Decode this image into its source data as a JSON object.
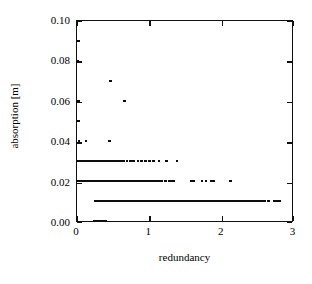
{
  "chart_data": {
    "type": "scatter",
    "title": "",
    "xlabel": "redundancy",
    "ylabel": "absorption [m]",
    "xlim": [
      0,
      3
    ],
    "ylim": [
      0.0,
      0.1
    ],
    "xticks": [
      0,
      1,
      2,
      3
    ],
    "yticks": [
      0.0,
      0.02,
      0.04,
      0.06,
      0.08,
      0.1
    ],
    "xtick_labels": [
      "0",
      "1",
      "2",
      "3"
    ],
    "ytick_labels": [
      "0.00",
      "0.02",
      "0.04",
      "0.06",
      "0.08",
      "0.10"
    ],
    "grid": false,
    "legend": null,
    "marker": "square",
    "marker_color": "#0d0d0d",
    "marker_size_px": 2.6,
    "series": [
      {
        "name": "absorption",
        "points": [
          [
            0.02,
            0.09
          ],
          [
            0.012,
            0.08
          ],
          [
            0.47,
            0.07
          ],
          [
            0.02,
            0.06
          ],
          [
            0.665,
            0.06
          ],
          [
            0.02,
            0.05
          ],
          [
            0.03,
            0.04
          ],
          [
            0.125,
            0.04
          ],
          [
            0.45,
            0.04
          ],
          [
            0.02,
            0.03
          ],
          [
            0.05,
            0.03
          ],
          [
            0.09,
            0.03
          ],
          [
            0.13,
            0.03
          ],
          [
            0.175,
            0.03
          ],
          [
            0.205,
            0.03
          ],
          [
            0.235,
            0.03
          ],
          [
            0.265,
            0.03
          ],
          [
            0.3,
            0.03
          ],
          [
            0.33,
            0.03
          ],
          [
            0.36,
            0.03
          ],
          [
            0.39,
            0.03
          ],
          [
            0.42,
            0.03
          ],
          [
            0.45,
            0.03
          ],
          [
            0.48,
            0.03
          ],
          [
            0.51,
            0.03
          ],
          [
            0.54,
            0.03
          ],
          [
            0.575,
            0.03
          ],
          [
            0.61,
            0.03
          ],
          [
            0.65,
            0.03
          ],
          [
            0.7,
            0.03
          ],
          [
            0.745,
            0.03
          ],
          [
            0.79,
            0.03
          ],
          [
            0.85,
            0.03
          ],
          [
            0.9,
            0.03
          ],
          [
            0.955,
            0.03
          ],
          [
            1.01,
            0.03
          ],
          [
            1.065,
            0.03
          ],
          [
            1.145,
            0.03
          ],
          [
            1.245,
            0.03
          ],
          [
            1.395,
            0.03
          ],
          [
            0.015,
            0.02
          ],
          [
            0.035,
            0.02
          ],
          [
            0.055,
            0.02
          ],
          [
            0.075,
            0.02
          ],
          [
            0.095,
            0.02
          ],
          [
            0.115,
            0.02
          ],
          [
            0.135,
            0.02
          ],
          [
            0.155,
            0.02
          ],
          [
            0.175,
            0.02
          ],
          [
            0.195,
            0.02
          ],
          [
            0.215,
            0.02
          ],
          [
            0.235,
            0.02
          ],
          [
            0.255,
            0.02
          ],
          [
            0.275,
            0.02
          ],
          [
            0.295,
            0.02
          ],
          [
            0.315,
            0.02
          ],
          [
            0.335,
            0.02
          ],
          [
            0.355,
            0.02
          ],
          [
            0.375,
            0.02
          ],
          [
            0.395,
            0.02
          ],
          [
            0.415,
            0.02
          ],
          [
            0.435,
            0.02
          ],
          [
            0.455,
            0.02
          ],
          [
            0.475,
            0.02
          ],
          [
            0.495,
            0.02
          ],
          [
            0.515,
            0.02
          ],
          [
            0.535,
            0.02
          ],
          [
            0.555,
            0.02
          ],
          [
            0.575,
            0.02
          ],
          [
            0.595,
            0.02
          ],
          [
            0.615,
            0.02
          ],
          [
            0.635,
            0.02
          ],
          [
            0.655,
            0.02
          ],
          [
            0.675,
            0.02
          ],
          [
            0.695,
            0.02
          ],
          [
            0.715,
            0.02
          ],
          [
            0.735,
            0.02
          ],
          [
            0.755,
            0.02
          ],
          [
            0.775,
            0.02
          ],
          [
            0.795,
            0.02
          ],
          [
            0.815,
            0.02
          ],
          [
            0.835,
            0.02
          ],
          [
            0.855,
            0.02
          ],
          [
            0.875,
            0.02
          ],
          [
            0.895,
            0.02
          ],
          [
            0.915,
            0.02
          ],
          [
            0.935,
            0.02
          ],
          [
            0.955,
            0.02
          ],
          [
            0.975,
            0.02
          ],
          [
            0.995,
            0.02
          ],
          [
            1.015,
            0.02
          ],
          [
            1.035,
            0.02
          ],
          [
            1.055,
            0.02
          ],
          [
            1.075,
            0.02
          ],
          [
            1.095,
            0.02
          ],
          [
            1.115,
            0.02
          ],
          [
            1.135,
            0.02
          ],
          [
            1.155,
            0.02
          ],
          [
            1.175,
            0.02
          ],
          [
            1.235,
            0.02
          ],
          [
            1.29,
            0.02
          ],
          [
            1.325,
            0.02
          ],
          [
            1.355,
            0.02
          ],
          [
            1.6,
            0.02
          ],
          [
            1.635,
            0.02
          ],
          [
            1.745,
            0.02
          ],
          [
            1.8,
            0.02
          ],
          [
            1.875,
            0.02
          ],
          [
            1.905,
            0.02
          ],
          [
            2.145,
            0.02
          ],
          [
            0.255,
            0.01
          ],
          [
            0.275,
            0.01
          ],
          [
            0.295,
            0.01
          ],
          [
            0.315,
            0.01
          ],
          [
            0.335,
            0.01
          ],
          [
            0.355,
            0.01
          ],
          [
            0.375,
            0.01
          ],
          [
            0.395,
            0.01
          ],
          [
            0.415,
            0.01
          ],
          [
            0.435,
            0.01
          ],
          [
            0.455,
            0.01
          ],
          [
            0.475,
            0.01
          ],
          [
            0.495,
            0.01
          ],
          [
            0.515,
            0.01
          ],
          [
            0.535,
            0.01
          ],
          [
            0.555,
            0.01
          ],
          [
            0.575,
            0.01
          ],
          [
            0.595,
            0.01
          ],
          [
            0.615,
            0.01
          ],
          [
            0.635,
            0.01
          ],
          [
            0.655,
            0.01
          ],
          [
            0.675,
            0.01
          ],
          [
            0.695,
            0.01
          ],
          [
            0.715,
            0.01
          ],
          [
            0.735,
            0.01
          ],
          [
            0.755,
            0.01
          ],
          [
            0.775,
            0.01
          ],
          [
            0.795,
            0.01
          ],
          [
            0.815,
            0.01
          ],
          [
            0.835,
            0.01
          ],
          [
            0.855,
            0.01
          ],
          [
            0.875,
            0.01
          ],
          [
            0.895,
            0.01
          ],
          [
            0.915,
            0.01
          ],
          [
            0.935,
            0.01
          ],
          [
            0.955,
            0.01
          ],
          [
            0.975,
            0.01
          ],
          [
            0.995,
            0.01
          ],
          [
            1.015,
            0.01
          ],
          [
            1.035,
            0.01
          ],
          [
            1.055,
            0.01
          ],
          [
            1.075,
            0.01
          ],
          [
            1.095,
            0.01
          ],
          [
            1.115,
            0.01
          ],
          [
            1.135,
            0.01
          ],
          [
            1.155,
            0.01
          ],
          [
            1.175,
            0.01
          ],
          [
            1.195,
            0.01
          ],
          [
            1.215,
            0.01
          ],
          [
            1.235,
            0.01
          ],
          [
            1.255,
            0.01
          ],
          [
            1.275,
            0.01
          ],
          [
            1.295,
            0.01
          ],
          [
            1.315,
            0.01
          ],
          [
            1.335,
            0.01
          ],
          [
            1.355,
            0.01
          ],
          [
            1.375,
            0.01
          ],
          [
            1.395,
            0.01
          ],
          [
            1.415,
            0.01
          ],
          [
            1.435,
            0.01
          ],
          [
            1.455,
            0.01
          ],
          [
            1.475,
            0.01
          ],
          [
            1.495,
            0.01
          ],
          [
            1.515,
            0.01
          ],
          [
            1.535,
            0.01
          ],
          [
            1.555,
            0.01
          ],
          [
            1.575,
            0.01
          ],
          [
            1.595,
            0.01
          ],
          [
            1.615,
            0.01
          ],
          [
            1.635,
            0.01
          ],
          [
            1.655,
            0.01
          ],
          [
            1.675,
            0.01
          ],
          [
            1.695,
            0.01
          ],
          [
            1.715,
            0.01
          ],
          [
            1.735,
            0.01
          ],
          [
            1.755,
            0.01
          ],
          [
            1.775,
            0.01
          ],
          [
            1.795,
            0.01
          ],
          [
            1.815,
            0.01
          ],
          [
            1.835,
            0.01
          ],
          [
            1.855,
            0.01
          ],
          [
            1.875,
            0.01
          ],
          [
            1.895,
            0.01
          ],
          [
            1.915,
            0.01
          ],
          [
            1.935,
            0.01
          ],
          [
            1.955,
            0.01
          ],
          [
            1.975,
            0.01
          ],
          [
            1.995,
            0.01
          ],
          [
            2.015,
            0.01
          ],
          [
            2.035,
            0.01
          ],
          [
            2.055,
            0.01
          ],
          [
            2.075,
            0.01
          ],
          [
            2.095,
            0.01
          ],
          [
            2.115,
            0.01
          ],
          [
            2.135,
            0.01
          ],
          [
            2.155,
            0.01
          ],
          [
            2.175,
            0.01
          ],
          [
            2.195,
            0.01
          ],
          [
            2.215,
            0.01
          ],
          [
            2.235,
            0.01
          ],
          [
            2.255,
            0.01
          ],
          [
            2.275,
            0.01
          ],
          [
            2.295,
            0.01
          ],
          [
            2.315,
            0.01
          ],
          [
            2.335,
            0.01
          ],
          [
            2.355,
            0.01
          ],
          [
            2.375,
            0.01
          ],
          [
            2.395,
            0.01
          ],
          [
            2.415,
            0.01
          ],
          [
            2.435,
            0.01
          ],
          [
            2.455,
            0.01
          ],
          [
            2.475,
            0.01
          ],
          [
            2.495,
            0.01
          ],
          [
            2.515,
            0.01
          ],
          [
            2.535,
            0.01
          ],
          [
            2.555,
            0.01
          ],
          [
            2.575,
            0.01
          ],
          [
            2.595,
            0.01
          ],
          [
            2.615,
            0.01
          ],
          [
            2.675,
            0.01
          ],
          [
            2.755,
            0.01
          ],
          [
            2.795,
            0.01
          ],
          [
            2.825,
            0.01
          ],
          [
            0.245,
            0.0
          ],
          [
            0.275,
            0.0
          ],
          [
            0.305,
            0.0
          ],
          [
            0.335,
            0.0
          ],
          [
            0.365,
            0.0
          ],
          [
            0.395,
            0.0
          ]
        ]
      }
    ]
  },
  "axes": {
    "x_title": "redundancy",
    "y_title": "absorption [m]",
    "x_tick_labels": [
      "0",
      "1",
      "2",
      "3"
    ],
    "y_tick_labels": [
      "0.00",
      "0.02",
      "0.04",
      "0.06",
      "0.08",
      "0.10"
    ]
  },
  "colors": {
    "marker": "#0d0d0d",
    "frame": "#111111",
    "background": "#ffffff"
  }
}
